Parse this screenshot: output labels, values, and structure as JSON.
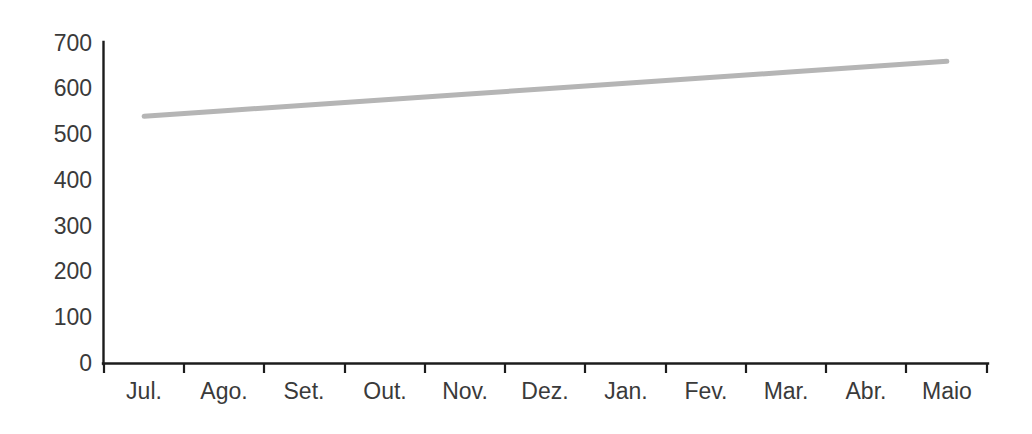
{
  "chart_data": {
    "type": "line",
    "title": "",
    "subtitle": "",
    "xlabel": "",
    "ylabel": "",
    "categories": [
      "Jul.",
      "Ago.",
      "Set.",
      "Out.",
      "Nov.",
      "Dez.",
      "Jan.",
      "Fev.",
      "Mar.",
      "Abr.",
      "Maio"
    ],
    "series": [
      {
        "name": "",
        "color": "#b5b5b5",
        "values": [
          540,
          552,
          564,
          576,
          588,
          600,
          612,
          624,
          636,
          648,
          660
        ]
      }
    ],
    "ylim": [
      0,
      700
    ],
    "yticks": [
      0,
      100,
      200,
      300,
      400,
      500,
      600,
      700
    ],
    "ytick_labels": [
      "0",
      "100",
      "200",
      "300",
      "400",
      "500",
      "600",
      "700"
    ],
    "xtick_labels": [
      "Jul.",
      "Ago.",
      "Set.",
      "Out.",
      "Nov.",
      "Dez.",
      "Jan.",
      "Fev.",
      "Mar.",
      "Abr.",
      "Maio"
    ],
    "grid": false,
    "legend": false,
    "legend_position": "none",
    "annotations": []
  },
  "axes": {
    "y_axis_name": "value-axis",
    "x_axis_name": "month-axis",
    "axis_color": "#1c1c1c"
  },
  "colors": {
    "background": "#ffffff",
    "axis": "#1c1c1c",
    "text": "#3a3a3a",
    "series_1": "#b5b5b5"
  }
}
